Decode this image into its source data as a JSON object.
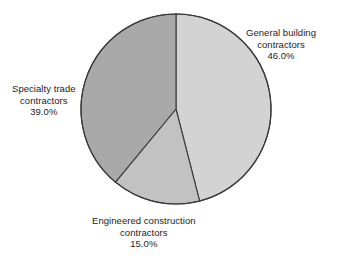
{
  "chart_data": {
    "type": "pie",
    "title": "",
    "subtitle": "",
    "xlabel": "",
    "ylabel": "",
    "grid": false,
    "legend_position": "none",
    "label_mode": "outside-callout",
    "start_angle_deg": 0,
    "direction": "clockwise",
    "categories": [
      "General building contractors",
      "Engineered construction contractors",
      "Specialty trade contractors"
    ],
    "values": [
      46.0,
      15.0,
      39.0
    ],
    "value_labels": [
      "46.0%",
      "15.0%",
      "39.0%"
    ],
    "colors": [
      "#d3d3d3",
      "#c2c2c2",
      "#a9a9a9"
    ],
    "slices": [
      {
        "name": "General building contractors",
        "value": 46.0,
        "value_label": "46.0%",
        "color": "#d3d3d3",
        "start_deg": 0,
        "end_deg": 165.6
      },
      {
        "name": "Engineered construction contractors",
        "value": 15.0,
        "value_label": "15.0%",
        "color": "#c2c2c2",
        "start_deg": 165.6,
        "end_deg": 219.6
      },
      {
        "name": "Specialty trade contractors",
        "value": 39.0,
        "value_label": "39.0%",
        "color": "#a9a9a9",
        "start_deg": 219.6,
        "end_deg": 360
      }
    ],
    "outline_color": "#3a3a3a",
    "background": "#ffffff"
  },
  "labels": {
    "general": {
      "line1": "General building",
      "line2": "contractors",
      "value": "46.0%"
    },
    "specialty": {
      "line1": "Specialty trade",
      "line2": "contractors",
      "value": "39.0%"
    },
    "engineered": {
      "line1": "Engineered construction",
      "line2": "contractors",
      "value": "15.0%"
    }
  }
}
